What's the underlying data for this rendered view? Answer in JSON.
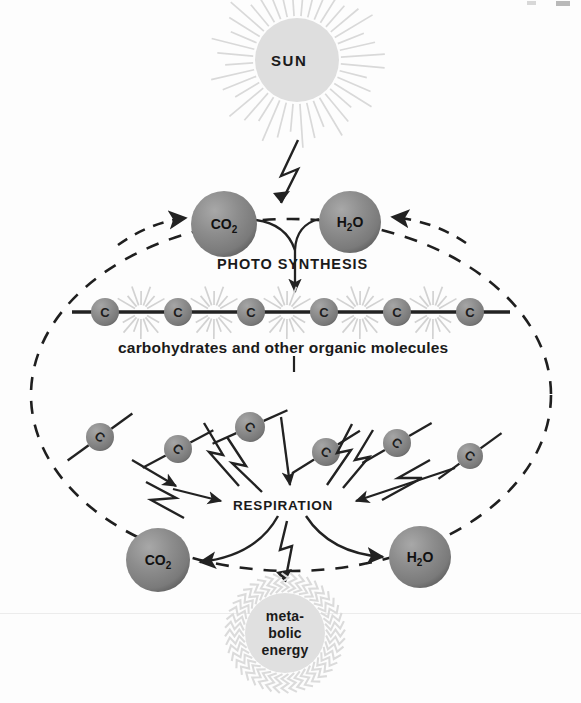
{
  "diagram": {
    "background_color": "#fdfdfd",
    "sphere_color": "#8a8a8a",
    "sphere_shadow_color": "#5e5e5e",
    "sun_color": "#dcdcdc",
    "ray_color": "#d5d5d5",
    "line_color": "#2b2b2b"
  },
  "sun": {
    "label": "SUN",
    "cx": 297,
    "cy": 60,
    "r": 42,
    "ray_count": 40
  },
  "photosynthesis": {
    "label": "PHOTO SYNTHESIS",
    "inputs": [
      {
        "label": "CO",
        "subscript": "2",
        "cx": 224,
        "cy": 224,
        "r": 33
      },
      {
        "label": "H",
        "subscript": "2",
        "suffix": "O",
        "cx": 350,
        "cy": 222,
        "r": 31
      }
    ]
  },
  "carbon_chain": {
    "caption": "carbohydrates and other organic molecules",
    "atom_label": "C",
    "y": 312,
    "line_start_x": 72,
    "line_end_x": 510,
    "atoms": [
      {
        "cx": 105,
        "cy": 312,
        "r": 14
      },
      {
        "cx": 178,
        "cy": 312,
        "r": 14
      },
      {
        "cx": 251,
        "cy": 312,
        "r": 14
      },
      {
        "cx": 324,
        "cy": 312,
        "r": 14
      },
      {
        "cx": 397,
        "cy": 312,
        "r": 14
      },
      {
        "cx": 470,
        "cy": 312,
        "r": 14
      }
    ],
    "burst_x": [
      141,
      214,
      287,
      360,
      433
    ]
  },
  "scattered_carbons": {
    "atom_label": "C",
    "atoms": [
      {
        "cx": 100,
        "cy": 437,
        "r": 14,
        "angle": -36
      },
      {
        "cx": 178,
        "cy": 449,
        "r": 14,
        "angle": -28
      },
      {
        "cx": 250,
        "cy": 427,
        "r": 15,
        "angle": -24
      },
      {
        "cx": 326,
        "cy": 452,
        "r": 14,
        "angle": -32
      },
      {
        "cx": 397,
        "cy": 443,
        "r": 14,
        "angle": -30
      },
      {
        "cx": 470,
        "cy": 456,
        "r": 13,
        "angle": -36
      }
    ]
  },
  "respiration": {
    "label": "RESPIRATION",
    "x": 233,
    "y": 498,
    "outputs": [
      {
        "label": "CO",
        "subscript": "2",
        "cx": 158,
        "cy": 560,
        "r": 32
      },
      {
        "label": "H",
        "subscript": "2",
        "suffix": "O",
        "cx": 420,
        "cy": 557,
        "r": 31
      }
    ]
  },
  "metabolic_energy": {
    "lines": [
      "meta-",
      "bolic",
      "energy"
    ],
    "cx": 285,
    "cy": 633,
    "r": 40,
    "ray_count": 44
  },
  "recycle_loop": {
    "description": "dashed ellipse connecting respiration products back to photosynthesis inputs",
    "style": "dashed",
    "cx": 291,
    "cy": 395,
    "rx": 260,
    "ry": 175
  }
}
